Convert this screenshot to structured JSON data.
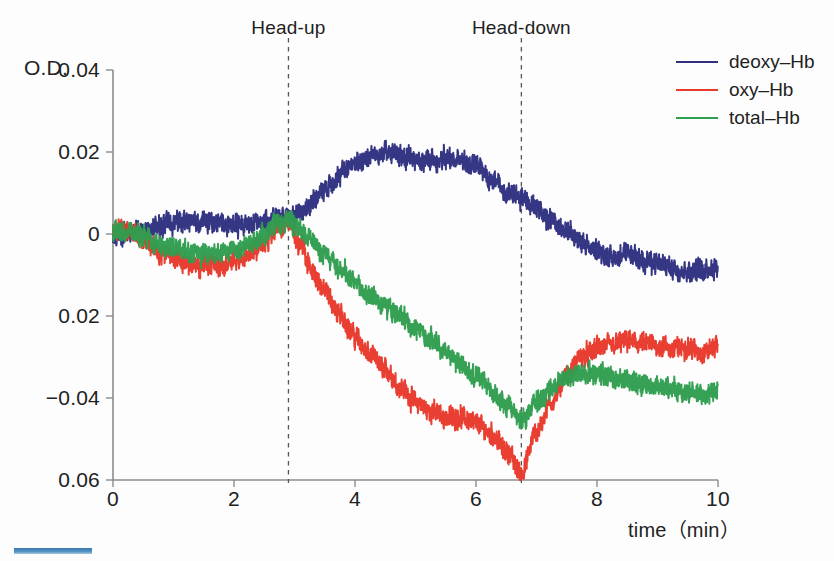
{
  "figure": {
    "background": "#fdfdfd",
    "axis_color": "#8c8c8c",
    "text_color": "#222222"
  },
  "axes": {
    "y_axis_label": "O.D.",
    "x_axis_title": "time（min）",
    "y_ticks": [
      "0.04",
      "0.02",
      "0",
      "0.02",
      "−0.04",
      "0.06"
    ],
    "y_tick_values": [
      0.04,
      0.02,
      0,
      -0.02,
      -0.04,
      -0.06
    ],
    "x_ticks": [
      "0",
      "2",
      "4",
      "6",
      "8",
      "10"
    ],
    "x_tick_values": [
      0,
      2,
      4,
      6,
      8,
      10
    ]
  },
  "annotations": [
    {
      "label": "Head-up",
      "x": 2.9
    },
    {
      "label": "Head-down",
      "x": 6.75
    }
  ],
  "legend": {
    "position": "top-right",
    "items": [
      {
        "label": "deoxy–Hb",
        "color": "#2e3080",
        "series": "deoxy"
      },
      {
        "label": "oxy–Hb",
        "color": "#e8392b",
        "series": "oxy"
      },
      {
        "label": "total–Hb",
        "color": "#2f9e4f",
        "series": "total"
      }
    ]
  },
  "chart_data": {
    "type": "line",
    "title": "",
    "subtitle": "",
    "xlabel": "time（min）",
    "ylabel": "O.D.",
    "xlim": [
      0,
      10
    ],
    "ylim": [
      -0.06,
      0.04
    ],
    "grid": false,
    "legend_position": "top-right",
    "noise_amplitude": 0.0016,
    "annotations": [
      {
        "label": "Head-up",
        "x": 2.9,
        "style": "dashed-vline"
      },
      {
        "label": "Head-down",
        "x": 6.75,
        "style": "dashed-vline"
      }
    ],
    "x": [
      0.0,
      0.25,
      0.5,
      0.75,
      1.0,
      1.25,
      1.5,
      1.75,
      2.0,
      2.25,
      2.5,
      2.75,
      2.9,
      3.1,
      3.3,
      3.5,
      3.75,
      4.0,
      4.25,
      4.5,
      4.75,
      5.0,
      5.25,
      5.5,
      5.75,
      6.0,
      6.25,
      6.5,
      6.75,
      7.0,
      7.25,
      7.5,
      7.75,
      8.0,
      8.25,
      8.5,
      8.75,
      9.0,
      9.25,
      9.5,
      9.75,
      10.0
    ],
    "series": [
      {
        "name": "deoxy–Hb",
        "color": "#2e3080",
        "values": [
          0.0,
          0.0004,
          0.0008,
          0.0018,
          0.0028,
          0.0032,
          0.003,
          0.0026,
          0.002,
          0.0026,
          0.0035,
          0.004,
          0.0032,
          0.005,
          0.0082,
          0.011,
          0.0145,
          0.0172,
          0.0192,
          0.02,
          0.019,
          0.018,
          0.0182,
          0.0184,
          0.0178,
          0.0168,
          0.0132,
          0.0104,
          0.009,
          0.0064,
          0.0034,
          0.0008,
          -0.002,
          -0.0044,
          -0.0056,
          -0.005,
          -0.0062,
          -0.0075,
          -0.0082,
          -0.009,
          -0.0086,
          -0.0078
        ]
      },
      {
        "name": "oxy–Hb",
        "color": "#e8392b",
        "values": [
          0.0008,
          0.001,
          -0.0012,
          -0.0044,
          -0.0058,
          -0.0074,
          -0.0082,
          -0.0078,
          -0.0066,
          -0.005,
          -0.0022,
          0.0018,
          0.0026,
          -0.003,
          -0.009,
          -0.014,
          -0.0196,
          -0.025,
          -0.0296,
          -0.033,
          -0.0372,
          -0.041,
          -0.0432,
          -0.0448,
          -0.0446,
          -0.0462,
          -0.0486,
          -0.053,
          -0.0582,
          -0.0482,
          -0.0408,
          -0.0346,
          -0.03,
          -0.0278,
          -0.027,
          -0.0262,
          -0.0268,
          -0.0272,
          -0.028,
          -0.0276,
          -0.029,
          -0.0272
        ]
      },
      {
        "name": "total–Hb",
        "color": "#2f9e4f",
        "values": [
          0.0006,
          0.0008,
          -0.0006,
          -0.0024,
          -0.0034,
          -0.0044,
          -0.0048,
          -0.0046,
          -0.0038,
          -0.0026,
          -0.0004,
          0.003,
          0.0034,
          0.0012,
          -0.0016,
          -0.0046,
          -0.0084,
          -0.0122,
          -0.0152,
          -0.0176,
          -0.0204,
          -0.0228,
          -0.0256,
          -0.0288,
          -0.0318,
          -0.0346,
          -0.0382,
          -0.042,
          -0.0452,
          -0.0412,
          -0.0378,
          -0.0348,
          -0.0336,
          -0.0342,
          -0.0352,
          -0.0358,
          -0.0364,
          -0.0372,
          -0.038,
          -0.0386,
          -0.0392,
          -0.0388
        ]
      }
    ]
  }
}
